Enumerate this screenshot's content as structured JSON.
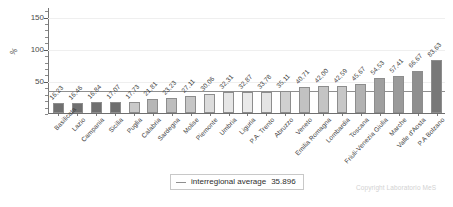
{
  "chart_data": {
    "type": "bar",
    "title": "",
    "subtitle": "",
    "xlabel": "",
    "ylabel": "%",
    "ylim": [
      0,
      165
    ],
    "grid": true,
    "y_ticks": [
      50,
      100,
      150
    ],
    "y_tick_labels": [
      "50",
      "100",
      "150"
    ],
    "legend_position": "bottom-center",
    "categories": [
      "Basilicata",
      "Lazio",
      "Campania",
      "Sicilia",
      "Puglia",
      "Calabria",
      "Sardegna",
      "Molise",
      "Piemonte",
      "Umbria",
      "Liguria",
      "P.A. Trento",
      "Abruzzo",
      "Veneto",
      "Emilia Romagna",
      "Lombardia",
      "Toscana",
      "Friuli-Venezia Giulia",
      "Marche",
      "Valle d'Aosta",
      "P.A Bolzano"
    ],
    "values": [
      16.23,
      16.46,
      16.84,
      17.07,
      17.73,
      21.81,
      23.23,
      27.11,
      30.06,
      32.31,
      32.87,
      33.78,
      35.11,
      40.71,
      42.0,
      42.59,
      45.67,
      54.53,
      57.41,
      66.67,
      83.63
    ],
    "value_labels": [
      "16,23",
      "16,46",
      "16,84",
      "17,07",
      "17,73",
      "21,81",
      "23,23",
      "27,11",
      "30,06",
      "32,31",
      "32,87",
      "33,78",
      "35,11",
      "40,71",
      "42,00",
      "42,59",
      "45,67",
      "54,53",
      "57,41",
      "66,67",
      "83,63"
    ],
    "bar_colors": [
      "#707070",
      "#707070",
      "#6f6f6f",
      "#6e6e6e",
      "#c9c9c9",
      "#b6b6b6",
      "#bdbdbd",
      "#c6c6c6",
      "#dcdcdc",
      "#e6e6e6",
      "#eaeaea",
      "#e4e4e4",
      "#d0d0d0",
      "#c2c2c2",
      "#c4c4c4",
      "#c7c7c7",
      "#b2b2b2",
      "#9f9f9f",
      "#9a9a9a",
      "#8f8f8f",
      "#787878"
    ],
    "annotations": [
      {
        "name": "interregional-average",
        "label": "interregional average",
        "value": 35.896,
        "value_text": "35.896",
        "line_color": "#8f8f8f"
      }
    ]
  },
  "legend": {
    "label": "interregional average",
    "value": "35.896"
  },
  "footer": {
    "copyright": "Copyright Laboratorio MeS"
  },
  "colors": {
    "axis": "#6f6f6f",
    "grid": "#efefef",
    "average_line": "#8f8f8f",
    "text": "#3c3c3c",
    "copyright": "#d2d2d2"
  }
}
